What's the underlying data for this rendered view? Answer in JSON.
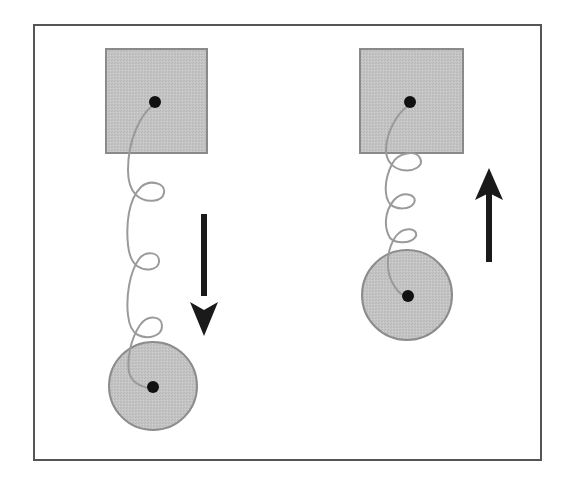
{
  "diagram": {
    "colors": {
      "background": "#ffffff",
      "frame": "#555555",
      "block_fill": "#c4c4c4",
      "block_stroke": "#8a8a8a",
      "mass_fill": "#c2c2c2",
      "mass_stroke": "#8c8c8c",
      "spring": "#9a9a9a",
      "pivot": "#111111",
      "arrow": "#1a1a1a"
    },
    "frame": {
      "x": 34,
      "y": 25,
      "width": 507,
      "height": 435
    },
    "systems": [
      {
        "id": "left",
        "state": "stretched",
        "support": {
          "x": 106,
          "y": 49,
          "width": 101,
          "height": 104,
          "pivot": [
            155,
            102
          ]
        },
        "mass": {
          "cx": 153,
          "cy": 386,
          "r": 44
        },
        "spring_coils": 3,
        "motion": {
          "direction": "down",
          "x": 204,
          "y_start": 214,
          "y_end": 334
        }
      },
      {
        "id": "right",
        "state": "compressed",
        "support": {
          "x": 360,
          "y": 49,
          "width": 103,
          "height": 104,
          "pivot": [
            410,
            102
          ]
        },
        "mass": {
          "cx": 407,
          "cy": 295,
          "r": 45
        },
        "spring_coils": 3,
        "motion": {
          "direction": "up",
          "x": 489,
          "y_start": 262,
          "y_end": 168
        }
      }
    ]
  }
}
